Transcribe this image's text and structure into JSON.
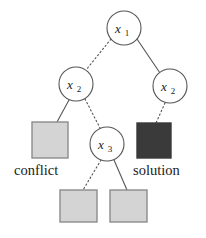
{
  "figure": {
    "background_color": "#ffffff",
    "width": 206,
    "height": 238
  },
  "colors": {
    "stroke": "#555555",
    "node_fill": "#ffffff",
    "leaf_gray_fill": "#d4d4d4",
    "leaf_gray_border": "#8c8c8c",
    "leaf_dark_fill": "#3a3a3a",
    "leaf_dark_border": "#3a3a3a",
    "text": "#1a1a1a"
  },
  "nodes": [
    {
      "id": "root",
      "var": "x",
      "sub": "1",
      "label": "x1",
      "cx": 124,
      "cy": 28,
      "r": 17
    },
    {
      "id": "x2-left",
      "var": "x",
      "sub": "2",
      "label": "x2",
      "cx": 76,
      "cy": 84,
      "r": 17
    },
    {
      "id": "x2-right",
      "var": "x",
      "sub": "2",
      "label": "x2",
      "cx": 170,
      "cy": 86,
      "r": 17
    },
    {
      "id": "x3",
      "var": "x",
      "sub": "3",
      "label": "x3",
      "cx": 107,
      "cy": 144,
      "r": 17
    }
  ],
  "leaves": [
    {
      "id": "conflict-leaf",
      "kind": "gray",
      "x": 32,
      "y": 122,
      "w": 36,
      "h": 36
    },
    {
      "id": "solution-leaf",
      "kind": "dark",
      "x": 137,
      "y": 123,
      "w": 34,
      "h": 35
    },
    {
      "id": "bottom-left-leaf",
      "kind": "gray",
      "x": 60,
      "y": 190,
      "w": 37,
      "h": 32
    },
    {
      "id": "bottom-right-leaf",
      "kind": "gray",
      "x": 110,
      "y": 190,
      "w": 37,
      "h": 32
    }
  ],
  "edges": [
    {
      "id": "root-to-x2-left",
      "from": "root",
      "to": "x2-left",
      "style": "dotted",
      "x1": 111,
      "y1": 39,
      "x2": 86,
      "y2": 70
    },
    {
      "id": "root-to-x2-right",
      "from": "root",
      "to": "x2-right",
      "style": "solid",
      "x1": 137,
      "y1": 39,
      "x2": 160,
      "y2": 73
    },
    {
      "id": "x2-left-to-conflict",
      "from": "x2-left",
      "to": "conflict-leaf",
      "style": "solid",
      "x1": 69,
      "y1": 100,
      "x2": 57,
      "y2": 122
    },
    {
      "id": "x2-left-to-x3",
      "from": "x2-left",
      "to": "x3",
      "style": "dotted",
      "x1": 85,
      "y1": 99,
      "x2": 100,
      "y2": 128
    },
    {
      "id": "x2-right-to-solution",
      "from": "x2-right",
      "to": "solution-leaf",
      "style": "dotted",
      "x1": 165,
      "y1": 103,
      "x2": 156,
      "y2": 123
    },
    {
      "id": "x3-to-bottom-left",
      "from": "x3",
      "to": "bottom-left-leaf",
      "style": "dotted",
      "x1": 101,
      "y1": 160,
      "x2": 83,
      "y2": 190
    },
    {
      "id": "x3-to-bottom-right",
      "from": "x3",
      "to": "bottom-right-leaf",
      "style": "solid",
      "x1": 114,
      "y1": 160,
      "x2": 127,
      "y2": 190
    }
  ],
  "captions": [
    {
      "id": "conflict-caption",
      "text": "conflict",
      "x": 14,
      "y": 175
    },
    {
      "id": "solution-caption",
      "text": "solution",
      "x": 133,
      "y": 175
    }
  ]
}
